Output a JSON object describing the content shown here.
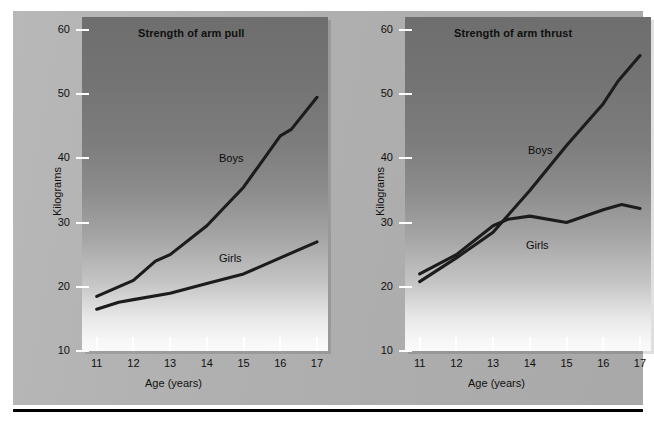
{
  "figure": {
    "background_color": "#b0b0b0",
    "rule_color": "#000000"
  },
  "chart_data": [
    {
      "type": "line",
      "title": "Strength of arm pull",
      "xlabel": "Age (years)",
      "ylabel": "Kilograms",
      "x": [
        11,
        12,
        13,
        14,
        15,
        16,
        17
      ],
      "xticklabels": [
        "11",
        "12",
        "13",
        "14",
        "15",
        "16",
        "17"
      ],
      "yticks": [
        10,
        20,
        30,
        40,
        50,
        60
      ],
      "yticklabels": [
        "10",
        "20",
        "30",
        "40",
        "50",
        "60"
      ],
      "xlim": [
        10.6,
        17.3
      ],
      "ylim": [
        10,
        62
      ],
      "grid": false,
      "legend_position": "inline-annotations",
      "series": [
        {
          "name": "Boys",
          "color": "#1c1c1c",
          "values": [
            18.5,
            21.0,
            24.0,
            25.0,
            29.5,
            35.5,
            43.5,
            44.5,
            49.5
          ],
          "x_detail": [
            11,
            12,
            12.6,
            13,
            14,
            15,
            16,
            16.3,
            17
          ],
          "label_x": 14.5,
          "label_y": 37.5
        },
        {
          "name": "Girls",
          "color": "#1c1c1c",
          "values": [
            16.5,
            17.6,
            18.0,
            19.0,
            20.5,
            22.0,
            24.5,
            27.0
          ],
          "x_detail": [
            11,
            11.6,
            12,
            13,
            14,
            15,
            16,
            17
          ],
          "label_x": 14.5,
          "label_y": 24.8
        }
      ]
    },
    {
      "type": "line",
      "title": "Strength of arm thrust",
      "xlabel": "Age (years)",
      "ylabel": "Kilograms",
      "x": [
        11,
        12,
        13,
        14,
        15,
        16,
        17
      ],
      "xticklabels": [
        "11",
        "12",
        "13",
        "14",
        "15",
        "16",
        "17"
      ],
      "yticks": [
        10,
        20,
        30,
        40,
        50,
        60
      ],
      "yticklabels": [
        "10",
        "20",
        "30",
        "40",
        "50",
        "60"
      ],
      "xlim": [
        10.6,
        17.3
      ],
      "ylim": [
        10,
        62
      ],
      "grid": false,
      "legend_position": "inline-annotations",
      "series": [
        {
          "name": "Boys",
          "color": "#1c1c1c",
          "values": [
            20.8,
            24.5,
            28.5,
            35.0,
            42.0,
            48.5,
            52.0,
            56.0
          ],
          "x_detail": [
            11,
            12,
            13,
            14,
            15,
            16,
            16.4,
            17
          ],
          "label_x": 14.4,
          "label_y": 43.0
        },
        {
          "name": "Girls",
          "color": "#1c1c1c",
          "values": [
            22.0,
            25.0,
            29.5,
            30.5,
            31.0,
            30.0,
            32.0,
            32.8,
            32.2
          ],
          "x_detail": [
            11,
            12,
            13,
            13.4,
            14,
            15,
            16,
            16.5,
            17
          ],
          "label_x": 14.3,
          "label_y": 27.5
        }
      ]
    }
  ]
}
